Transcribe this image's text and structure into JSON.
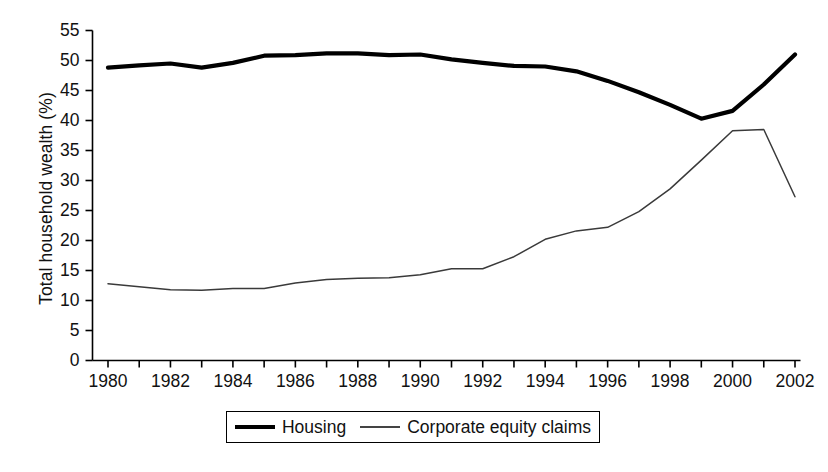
{
  "chart_data": {
    "type": "line",
    "title": "",
    "xlabel": "",
    "ylabel": "Total household wealth (%)",
    "xlim": [
      1980,
      2002
    ],
    "ylim": [
      0,
      55
    ],
    "yticks": [
      0,
      5,
      10,
      15,
      20,
      25,
      30,
      35,
      40,
      45,
      50,
      55
    ],
    "ytick_labels": [
      "0",
      "5",
      "10",
      "15",
      "20",
      "25",
      "30",
      "35",
      "40",
      "45",
      "50",
      "55"
    ],
    "xticks": [
      1980,
      1981,
      1982,
      1983,
      1984,
      1985,
      1986,
      1987,
      1988,
      1989,
      1990,
      1991,
      1992,
      1993,
      1994,
      1995,
      1996,
      1997,
      1998,
      1999,
      2000,
      2001,
      2002
    ],
    "xtick_labels": [
      "1980",
      "",
      "1982",
      "",
      "1984",
      "",
      "1986",
      "",
      "1988",
      "",
      "1990",
      "",
      "1992",
      "",
      "1994",
      "",
      "1996",
      "",
      "1998",
      "",
      "2000",
      "",
      "2002"
    ],
    "xtick_labels_shown": [
      "1980",
      "1982",
      "1984",
      "1986",
      "1988",
      "1990",
      "1992",
      "1994",
      "1996",
      "1998",
      "2000",
      "2002"
    ],
    "grid": false,
    "legend_position": "below-center",
    "x": [
      1980,
      1981,
      1982,
      1983,
      1984,
      1985,
      1986,
      1987,
      1988,
      1989,
      1990,
      1991,
      1992,
      1993,
      1994,
      1995,
      1996,
      1997,
      1998,
      1999,
      2000,
      2001,
      2002
    ],
    "series": [
      {
        "name": "Housing",
        "color": "#000000",
        "line_width": "thick",
        "values": [
          48.8,
          49.2,
          49.5,
          48.8,
          49.6,
          50.8,
          50.9,
          51.2,
          51.2,
          50.9,
          51.0,
          50.2,
          49.6,
          49.1,
          49.0,
          48.2,
          46.6,
          44.7,
          42.6,
          40.3,
          41.6,
          46.0,
          51.0
        ]
      },
      {
        "name": "Corporate equity claims",
        "color": "#3a3a3a",
        "line_width": "thin",
        "values": [
          12.8,
          12.3,
          11.8,
          11.7,
          12.0,
          12.0,
          12.9,
          13.5,
          13.7,
          13.8,
          14.3,
          15.3,
          15.3,
          17.3,
          20.2,
          21.6,
          22.2,
          24.8,
          28.6,
          33.4,
          38.3,
          38.5,
          27.3
        ]
      }
    ]
  },
  "legend": {
    "entries": [
      {
        "label": "Housing"
      },
      {
        "label": "Corporate equity claims"
      }
    ]
  }
}
